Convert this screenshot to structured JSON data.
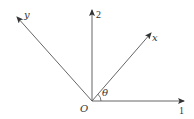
{
  "diagram": {
    "type": "coordinate-axes-rotation",
    "origin_label": "O",
    "angle_label": "θ",
    "axes": [
      {
        "id": "axis-1",
        "label": "1",
        "direction": "horizontal-right"
      },
      {
        "id": "axis-2",
        "label": "2",
        "direction": "vertical-up"
      },
      {
        "id": "axis-x",
        "label": "x",
        "direction": "rotated-by-theta"
      },
      {
        "id": "axis-y",
        "label": "y",
        "direction": "perpendicular-to-x"
      }
    ],
    "colors": {
      "line": "#555555",
      "text": "#333333",
      "background": "#ffffff"
    }
  }
}
